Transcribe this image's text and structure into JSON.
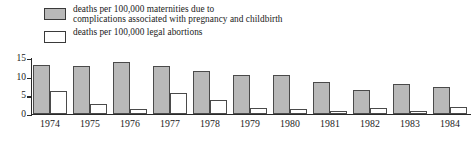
{
  "legend": {
    "position": "top-left",
    "entries": [
      {
        "swatch": "gray",
        "label": "deaths per 100,000 maternities due to\ncomplications associated with pregnancy and childbirth"
      },
      {
        "swatch": "white",
        "label": "deaths per 100,000 legal abortions"
      }
    ]
  },
  "axis": {
    "yticks": [
      "0",
      "5",
      "10",
      "15"
    ]
  },
  "chart_data": {
    "type": "bar",
    "title": "",
    "xlabel": "",
    "ylabel": "",
    "ylim": [
      0,
      15
    ],
    "yticks": [
      0,
      5,
      10,
      15
    ],
    "grid": false,
    "legend_position": "top-left",
    "categories": [
      "1974",
      "1975",
      "1976",
      "1977",
      "1978",
      "1979",
      "1980",
      "1981",
      "1982",
      "1983",
      "1984"
    ],
    "series": [
      {
        "name": "deaths per 100,000 maternities due to complications associated with pregnancy and childbirth",
        "color": "#b9b9b9",
        "values": [
          13.0,
          12.8,
          14.0,
          12.8,
          11.6,
          10.5,
          10.3,
          8.6,
          6.3,
          8.1,
          7.1
        ]
      },
      {
        "name": "deaths per 100,000 legal abortions",
        "color": "#ffffff",
        "values": [
          6.0,
          2.7,
          1.2,
          5.6,
          3.6,
          1.6,
          1.4,
          0.8,
          1.6,
          0.8,
          1.7
        ]
      }
    ]
  },
  "colors": {
    "series_gray": "#b9b9b9",
    "series_white": "#ffffff",
    "outline": "#4a4a4a",
    "axis": "#2a2a2a",
    "background": "#ffffff"
  }
}
